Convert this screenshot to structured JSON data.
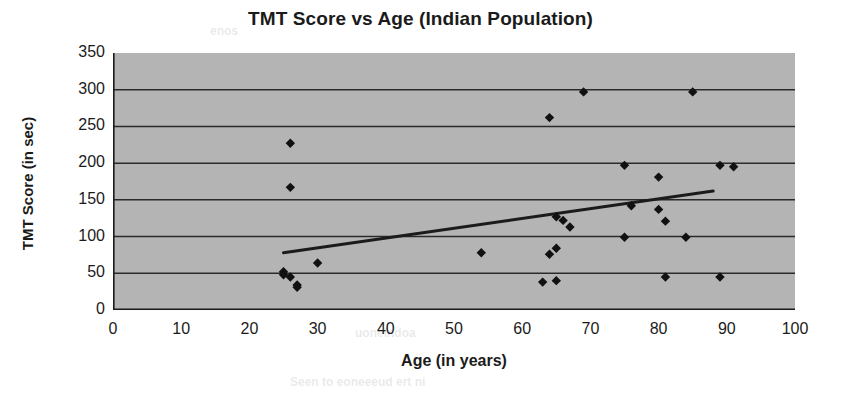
{
  "chart_data": {
    "type": "scatter",
    "title": "TMT Score vs Age (Indian Population)",
    "xlabel": "Age (in years)",
    "ylabel": "TMT Score (in sec)",
    "xlim": [
      0,
      100
    ],
    "ylim": [
      0,
      350
    ],
    "xticks": [
      0,
      10,
      20,
      30,
      40,
      50,
      60,
      70,
      80,
      90,
      100
    ],
    "yticks": [
      0,
      50,
      100,
      150,
      200,
      250,
      300,
      350
    ],
    "grid": "horizontal",
    "legend": "none",
    "plot_background_color": "#b4b4b4",
    "marker": {
      "shape": "diamond",
      "color": "#111111",
      "size": 7
    },
    "points": [
      {
        "x": 25,
        "y": 52
      },
      {
        "x": 25,
        "y": 48
      },
      {
        "x": 26,
        "y": 45
      },
      {
        "x": 26,
        "y": 167
      },
      {
        "x": 26,
        "y": 227
      },
      {
        "x": 27,
        "y": 34
      },
      {
        "x": 27,
        "y": 31
      },
      {
        "x": 30,
        "y": 64
      },
      {
        "x": 54,
        "y": 78
      },
      {
        "x": 63,
        "y": 38
      },
      {
        "x": 64,
        "y": 76
      },
      {
        "x": 64,
        "y": 262
      },
      {
        "x": 65,
        "y": 40
      },
      {
        "x": 65,
        "y": 84
      },
      {
        "x": 65,
        "y": 127
      },
      {
        "x": 66,
        "y": 122
      },
      {
        "x": 67,
        "y": 113
      },
      {
        "x": 69,
        "y": 297
      },
      {
        "x": 75,
        "y": 99
      },
      {
        "x": 75,
        "y": 197
      },
      {
        "x": 76,
        "y": 142
      },
      {
        "x": 80,
        "y": 181
      },
      {
        "x": 80,
        "y": 137
      },
      {
        "x": 81,
        "y": 121
      },
      {
        "x": 81,
        "y": 45
      },
      {
        "x": 84,
        "y": 99
      },
      {
        "x": 85,
        "y": 297
      },
      {
        "x": 89,
        "y": 45
      },
      {
        "x": 89,
        "y": 197
      },
      {
        "x": 91,
        "y": 195
      }
    ],
    "trendline": {
      "type": "linear",
      "color": "#1b1b1b",
      "x_start": 25,
      "y_start": 78,
      "x_end": 88,
      "y_end": 162
    }
  },
  "ghost_text": {
    "top": "enos",
    "mid": "uoneindoa",
    "bottom": "Seen to eoneeeud ert ni"
  }
}
